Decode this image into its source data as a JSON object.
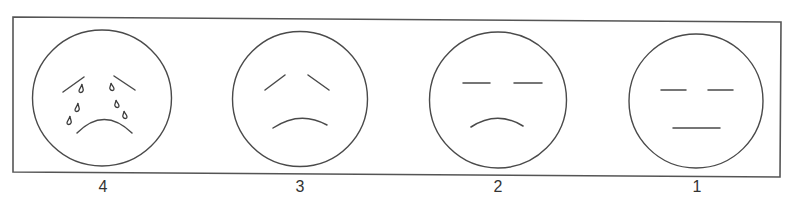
{
  "diagram": {
    "type": "pain-rating-face-scale",
    "frame_color": "#555555",
    "stroke_color": "#4a4a4a",
    "faces": [
      {
        "rating": "4",
        "expression": "crying",
        "eyes": "slanted-brows",
        "mouth": "frown",
        "tears": 6
      },
      {
        "rating": "3",
        "expression": "sad",
        "eyes": "slanted-brows",
        "mouth": "frown",
        "tears": 0
      },
      {
        "rating": "2",
        "expression": "slightly-sad",
        "eyes": "flat-lines",
        "mouth": "slight-frown",
        "tears": 0
      },
      {
        "rating": "1",
        "expression": "neutral",
        "eyes": "flat-lines",
        "mouth": "straight-line",
        "tears": 0
      }
    ]
  }
}
